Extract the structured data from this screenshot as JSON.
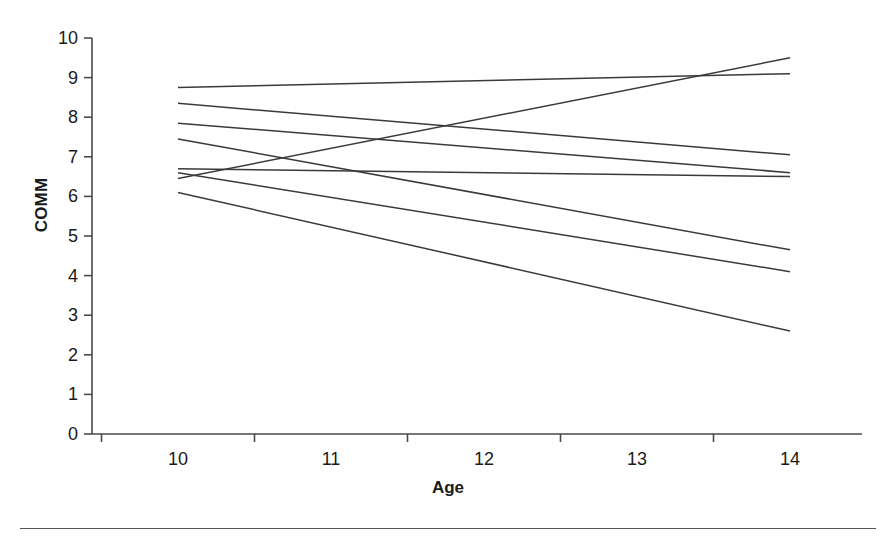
{
  "figure": {
    "background_color": "#ffffff",
    "line_color": "#3a3a3a",
    "axis_color": "#4a4a4a"
  },
  "axes": {
    "y_title": "COMM",
    "x_title": "Age",
    "y_ticks": [
      "0",
      "1",
      "2",
      "3",
      "4",
      "5",
      "6",
      "7",
      "8",
      "9",
      "10"
    ],
    "x_ticks": [
      "10",
      "11",
      "12",
      "13",
      "14"
    ]
  },
  "chart_data": {
    "type": "line",
    "title": "",
    "xlabel": "Age",
    "ylabel": "COMM",
    "xlim": [
      10,
      14
    ],
    "ylim": [
      0,
      10
    ],
    "grid": false,
    "legend": "none",
    "x": [
      10,
      14
    ],
    "series": [
      {
        "name": "line-1",
        "values": [
          8.75,
          9.1
        ]
      },
      {
        "name": "line-2",
        "values": [
          8.35,
          7.05
        ]
      },
      {
        "name": "line-3",
        "values": [
          7.85,
          6.6
        ]
      },
      {
        "name": "line-4",
        "values": [
          7.45,
          4.65
        ]
      },
      {
        "name": "line-5",
        "values": [
          6.7,
          6.5
        ]
      },
      {
        "name": "line-6",
        "values": [
          6.45,
          9.5
        ]
      },
      {
        "name": "line-7",
        "values": [
          6.6,
          4.1
        ]
      },
      {
        "name": "line-8",
        "values": [
          6.1,
          2.6
        ]
      }
    ]
  }
}
